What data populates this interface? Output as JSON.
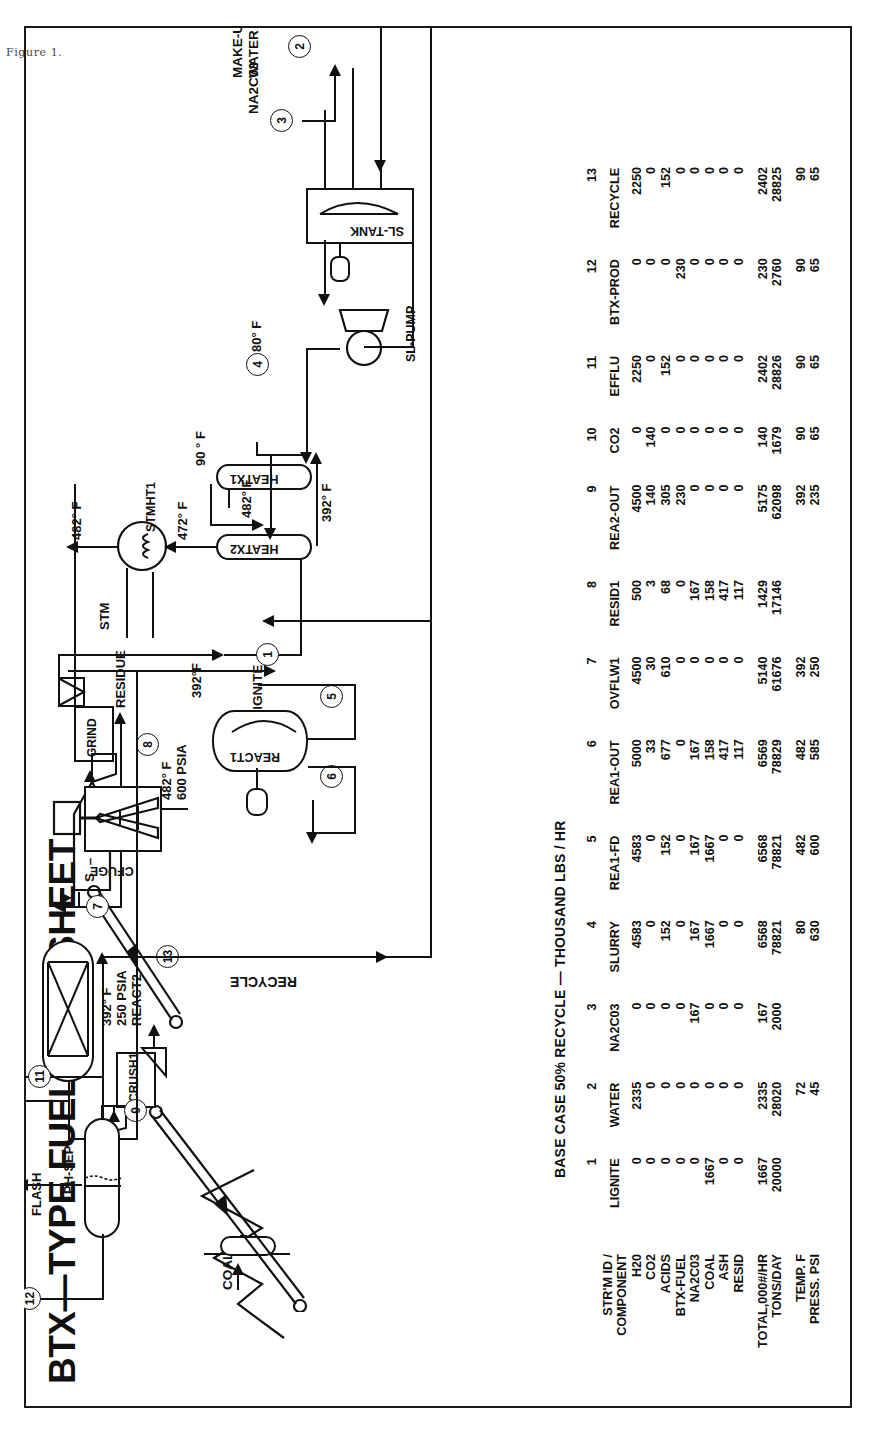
{
  "figure_caption": "Figure 1.",
  "title": "BTX—TYPE FUEL FLOWSHEET",
  "table_header": "BASE CASE 50% RECYCLE — THOUSAND LBS / HR",
  "table": {
    "corner_label_line1": "STR'M ID /",
    "corner_label_line2": "COMPONENT",
    "row_labels": [
      "H20",
      "CO2",
      "ACIDS",
      "BTX-FUEL",
      "NA2C03",
      "COAL",
      "ASH",
      "RESID"
    ],
    "footer_labels": [
      "TOTAL,000#/HR",
      "TONS/DAY",
      "TEMP. F",
      "PRESS. PSI"
    ],
    "columns": [
      {
        "num": "1",
        "name": "LIGNITE",
        "values": [
          "0",
          "0",
          "0",
          "0",
          "0",
          "1667",
          "0",
          "0"
        ],
        "total": "1667",
        "tons": "20000",
        "temp": "",
        "press": ""
      },
      {
        "num": "2",
        "name": "WATER",
        "values": [
          "2335",
          "0",
          "0",
          "0",
          "0",
          "0",
          "0",
          "0"
        ],
        "total": "2335",
        "tons": "28020",
        "temp": "72",
        "press": "45"
      },
      {
        "num": "3",
        "name": "NA2C03",
        "values": [
          "0",
          "0",
          "0",
          "0",
          "167",
          "0",
          "0",
          "0"
        ],
        "total": "167",
        "tons": "2000",
        "temp": "",
        "press": ""
      },
      {
        "num": "4",
        "name": "SLURRY",
        "values": [
          "4583",
          "0",
          "152",
          "0",
          "167",
          "1667",
          "0",
          "0"
        ],
        "total": "6568",
        "tons": "78821",
        "temp": "80",
        "press": "630"
      },
      {
        "num": "5",
        "name": "REA1-FD",
        "values": [
          "4583",
          "0",
          "152",
          "0",
          "167",
          "1667",
          "0",
          "0"
        ],
        "total": "6568",
        "tons": "78821",
        "temp": "482",
        "press": "600"
      },
      {
        "num": "6",
        "name": "REA1-OUT",
        "values": [
          "5000",
          "33",
          "677",
          "0",
          "167",
          "158",
          "417",
          "117"
        ],
        "total": "6569",
        "tons": "78829",
        "temp": "482",
        "press": "585"
      },
      {
        "num": "7",
        "name": "OVFLW1",
        "values": [
          "4500",
          "30",
          "610",
          "0",
          "0",
          "0",
          "0",
          "0"
        ],
        "total": "5140",
        "tons": "61676",
        "temp": "392",
        "press": "250"
      },
      {
        "num": "8",
        "name": "RESID1",
        "values": [
          "500",
          "3",
          "68",
          "0",
          "167",
          "158",
          "417",
          "117"
        ],
        "total": "1429",
        "tons": "17146",
        "temp": "",
        "press": ""
      },
      {
        "num": "9",
        "name": "REA2-OUT",
        "values": [
          "4500",
          "140",
          "305",
          "230",
          "0",
          "0",
          "0",
          "0"
        ],
        "total": "5175",
        "tons": "62098",
        "temp": "392",
        "press": "235"
      },
      {
        "num": "10",
        "name": "CO2",
        "values": [
          "0",
          "140",
          "0",
          "0",
          "0",
          "0",
          "0",
          "0"
        ],
        "total": "140",
        "tons": "1679",
        "temp": "90",
        "press": "65"
      },
      {
        "num": "11",
        "name": "EFFLU",
        "values": [
          "2250",
          "0",
          "152",
          "0",
          "0",
          "0",
          "0",
          "0"
        ],
        "total": "2402",
        "tons": "28826",
        "temp": "90",
        "press": "65"
      },
      {
        "num": "12",
        "name": "BTX-PROD",
        "values": [
          "0",
          "0",
          "0",
          "230",
          "0",
          "0",
          "0",
          "0"
        ],
        "total": "230",
        "tons": "2760",
        "temp": "90",
        "press": "65"
      },
      {
        "num": "13",
        "name": "RECYCLE",
        "values": [
          "2250",
          "0",
          "152",
          "0",
          "0",
          "0",
          "0",
          "0"
        ],
        "total": "2402",
        "tons": "28825",
        "temp": "90",
        "press": "65"
      }
    ]
  },
  "flowsheet": {
    "units": {
      "coal_pile": "COAL",
      "crusher": "CRUSH1",
      "silo": "S – L – O",
      "grinder": "GRIND",
      "slurry_tank": "SL-TANK",
      "slurry_pump": "SL-PUMP",
      "heatx1": "HEATX1",
      "heatx2": "HEATX2",
      "steam_heater": "STMHT1",
      "steam_in": "STM",
      "reactor1": "REACT1",
      "centrifuge": "CFUGE",
      "reactor2": "REACT2",
      "flash": "FLASH",
      "phase_separator": "PH-SEP"
    },
    "conditions": {
      "react1": "482° F\n600 PSIA",
      "react2": "392° F\n250 PSIA",
      "heatx1_in": "80° F",
      "heatx1_out": "90 ° F",
      "heatx2_hot_in": "392° F",
      "heatx2_out": "472° F",
      "stmht_out": "482° F",
      "heatx2_side": "482° F",
      "heatx2_bot": "392° F",
      "lignite_temp": "392°F"
    },
    "streams": [
      "1",
      "2",
      "3",
      "4",
      "5",
      "6",
      "7",
      "8",
      "9",
      "10",
      "11",
      "12",
      "13"
    ],
    "feed_labels": {
      "lignite": "LIGNITE",
      "na2co3": "NA2C03",
      "makeup_water": "MAKE-UP\nWATER"
    },
    "product_labels": {
      "co2": "CO₂",
      "fuel": "FUEL\nTO: STORAGE",
      "efflu": "EFFLU\nTO: WASTE\nTREATMENT\nPONDS",
      "residue": "RESIDUE",
      "recycle": "RECYCLE"
    }
  }
}
